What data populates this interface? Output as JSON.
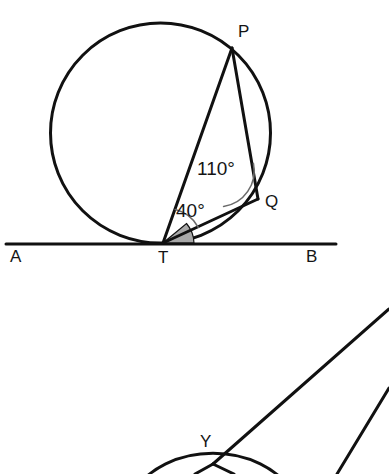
{
  "figure": {
    "background_color": "#ffffff",
    "line_color": "#111111",
    "arc_marker_color": "#6b6b6b",
    "shaded_angle_color": "#a8a8a8"
  },
  "top_diagram": {
    "circle": {
      "cx": 160.5,
      "cy": 133,
      "r": 110
    },
    "tangent_line": {
      "x1": 6,
      "y1": 244,
      "x2": 336,
      "y2": 244
    },
    "points": {
      "P": {
        "x": 232,
        "y": 48,
        "label": "P",
        "label_x": 238,
        "label_y": 33
      },
      "Q": {
        "x": 258,
        "y": 199,
        "label": "Q",
        "label_x": 265,
        "label_y": 203
      },
      "T": {
        "x": 163,
        "y": 243,
        "label": "T",
        "label_x": 158,
        "label_y": 259
      },
      "A": {
        "x": 15,
        "y": 244,
        "label": "A",
        "label_x": 10,
        "label_y": 258
      },
      "B": {
        "x": 312,
        "y": 244,
        "label": "B",
        "label_x": 306,
        "label_y": 258
      }
    },
    "segments": [
      {
        "name": "chord-T-P",
        "from": "T",
        "to": "P"
      },
      {
        "name": "chord-P-Q",
        "from": "P",
        "to": "Q"
      },
      {
        "name": "chord-T-Q",
        "from": "T",
        "to": "Q"
      }
    ],
    "angles": [
      {
        "name": "angle-at-Q",
        "vertex": "Q",
        "value": "110°",
        "label_x": 197,
        "label_y": 170,
        "marker": "arc"
      },
      {
        "name": "angle-at-T-PTQ",
        "vertex": "T",
        "value": "40°",
        "label_x": 176,
        "label_y": 212,
        "marker": "arc"
      },
      {
        "name": "angle-at-T-QTB",
        "vertex": "T",
        "value": "",
        "marker": "shaded-sector"
      }
    ]
  },
  "bottom_diagram": {
    "points": {
      "Y": {
        "x": 213,
        "y": 464,
        "label": "Y",
        "label_x": 200,
        "label_y": 443
      }
    },
    "segments": [
      {
        "name": "ray-Y-upper-right",
        "x1": 213,
        "y1": 464,
        "x2": 389,
        "y2": 309
      },
      {
        "name": "ray-lower-right",
        "x1": 389,
        "y1": 388,
        "x2": 338,
        "y2": 474
      },
      {
        "name": "ray-Y-down-left",
        "x1": 213,
        "y1": 464,
        "x2": 196,
        "y2": 474
      },
      {
        "name": "ray-Y-down-right",
        "x1": 213,
        "y1": 464,
        "x2": 232,
        "y2": 474
      }
    ],
    "arc": {
      "name": "partial-circle-arc",
      "cx": 213,
      "cy": 520,
      "r": 58,
      "description": "arc passing through Y opening downward"
    }
  }
}
